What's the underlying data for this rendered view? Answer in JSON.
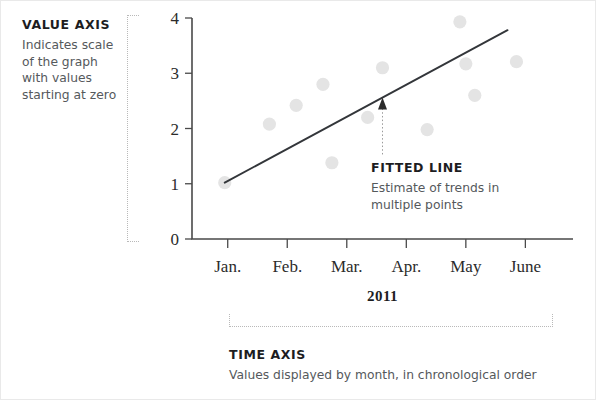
{
  "annotations": {
    "value_axis": {
      "title": "VALUE AXIS",
      "description": "Indicates scale of the graph with values starting at zero"
    },
    "fitted_line": {
      "title": "FITTED LINE",
      "description": "Estimate of trends in multiple points"
    },
    "time_axis": {
      "title": "TIME AXIS",
      "description": "Values displayed by month, in chronological order"
    }
  },
  "chart_data": {
    "type": "scatter",
    "title": "",
    "xlabel": "2011",
    "ylabel": "",
    "xlim": [
      0,
      6.4
    ],
    "ylim": [
      0,
      4
    ],
    "grid": false,
    "legend": false,
    "categories": [
      "Jan.",
      "Feb.",
      "Mar.",
      "Apr.",
      "May",
      "June"
    ],
    "xtick_labels": [
      "Jan.",
      "Feb.",
      "Mar.",
      "Apr.",
      "May",
      "June"
    ],
    "xtick_values": [
      0.6,
      1.6,
      2.6,
      3.6,
      4.6,
      5.6
    ],
    "ytick_labels": [
      "0",
      "1",
      "2",
      "3",
      "4"
    ],
    "ytick_values": [
      0,
      1,
      2,
      3,
      4
    ],
    "points": [
      {
        "x": 0.55,
        "y": 1.02
      },
      {
        "x": 1.3,
        "y": 2.08
      },
      {
        "x": 1.75,
        "y": 2.42
      },
      {
        "x": 2.2,
        "y": 2.8
      },
      {
        "x": 2.35,
        "y": 1.38
      },
      {
        "x": 2.95,
        "y": 2.2
      },
      {
        "x": 3.2,
        "y": 3.1
      },
      {
        "x": 3.95,
        "y": 1.98
      },
      {
        "x": 4.5,
        "y": 3.93
      },
      {
        "x": 4.6,
        "y": 3.17
      },
      {
        "x": 4.75,
        "y": 2.6
      },
      {
        "x": 5.45,
        "y": 3.21
      }
    ],
    "fit_line": {
      "label": "Fitted line",
      "x_start": 0.55,
      "y_start": 1.02,
      "x_end": 5.3,
      "y_end": 3.78
    },
    "callout_arrow": {
      "x": 3.2,
      "y": 2.47
    },
    "series": [
      {
        "name": "Observations",
        "x": [
          0.55,
          1.3,
          1.75,
          2.2,
          2.35,
          2.95,
          3.2,
          3.95,
          4.5,
          4.6,
          4.75,
          5.45
        ],
        "values": [
          1.02,
          2.08,
          2.42,
          2.8,
          1.38,
          2.2,
          3.1,
          1.98,
          3.93,
          3.17,
          2.6,
          3.21
        ]
      }
    ]
  }
}
